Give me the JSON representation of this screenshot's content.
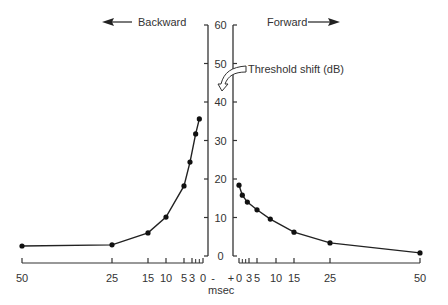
{
  "chart_data": {
    "type": "line",
    "title": "",
    "ylabel": "Threshold shift (dB)",
    "xlabel": "msec",
    "ylim": [
      0,
      60
    ],
    "y_ticks": [
      "0",
      "10",
      "20",
      "30",
      "40",
      "50",
      "60"
    ],
    "direction_labels": {
      "backward": "Backward",
      "forward": "Forward"
    },
    "x_ticks_backward": [
      "50",
      "25",
      "15",
      "10",
      "5",
      "3",
      "0",
      "-"
    ],
    "x_ticks_forward": [
      "+",
      "0",
      "3",
      "5",
      "10",
      "15",
      "25",
      "50"
    ],
    "series": [
      {
        "name": "Backward",
        "x_msec": [
          1,
          2,
          3.5,
          5,
          10,
          15,
          25,
          50
        ],
        "values": [
          35.6,
          31.7,
          24.4,
          18.2,
          10.1,
          6.0,
          2.9,
          2.6
        ]
      },
      {
        "name": "Forward",
        "x_msec": [
          0,
          1,
          2.5,
          5,
          8.5,
          15,
          25,
          50
        ],
        "values": [
          18.4,
          15.8,
          14.0,
          12.0,
          9.6,
          6.2,
          3.4,
          0.8
        ]
      }
    ],
    "grid": false,
    "legend": "none"
  }
}
